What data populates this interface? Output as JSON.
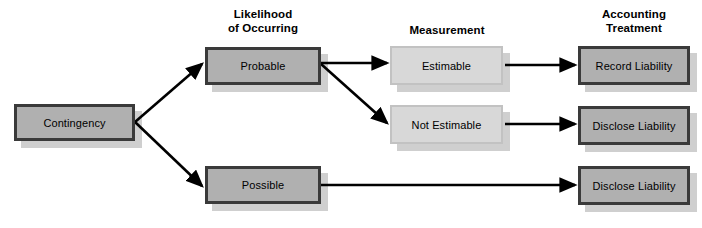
{
  "diagram": {
    "columns": [
      {
        "id": "likelihood",
        "heading": "Likelihood\nof Occurring"
      },
      {
        "id": "measurement",
        "heading": "Measurement"
      },
      {
        "id": "treatment",
        "heading": "Accounting\nTreatment"
      }
    ],
    "nodes": [
      {
        "id": "contingency",
        "label": "Contingency",
        "style": "dark",
        "x": 14,
        "y": 104,
        "w": 121,
        "h": 37
      },
      {
        "id": "probable",
        "label": "Probable",
        "style": "dark",
        "x": 205,
        "y": 47,
        "w": 116,
        "h": 38
      },
      {
        "id": "possible",
        "label": "Possible",
        "style": "dark",
        "x": 205,
        "y": 166,
        "w": 116,
        "h": 38
      },
      {
        "id": "estimable",
        "label": "Estimable",
        "style": "light",
        "x": 390,
        "y": 46,
        "w": 113,
        "h": 39
      },
      {
        "id": "not-estimable",
        "label": "Not Estimable",
        "style": "light",
        "x": 390,
        "y": 105,
        "w": 113,
        "h": 39
      },
      {
        "id": "record-liability",
        "label": "Record Liability",
        "style": "dark",
        "x": 578,
        "y": 46,
        "w": 112,
        "h": 39
      },
      {
        "id": "disclose-liability-1",
        "label": "Disclose Liability",
        "style": "dark",
        "x": 578,
        "y": 106,
        "w": 112,
        "h": 39
      },
      {
        "id": "disclose-liability-2",
        "label": "Disclose Liability",
        "style": "dark",
        "x": 578,
        "y": 166,
        "w": 112,
        "h": 39
      }
    ],
    "edges": [
      {
        "id": "contingency-to-probable",
        "from": "contingency",
        "to": "probable",
        "x1": 135,
        "y1": 122,
        "x2": 202,
        "y2": 64
      },
      {
        "id": "contingency-to-possible",
        "from": "contingency",
        "to": "possible",
        "x1": 135,
        "y1": 122,
        "x2": 202,
        "y2": 186
      },
      {
        "id": "probable-to-estimable",
        "from": "probable",
        "to": "estimable",
        "x1": 321,
        "y1": 63,
        "x2": 387,
        "y2": 63
      },
      {
        "id": "probable-to-not-estimable",
        "from": "probable",
        "to": "not-estimable",
        "x1": 321,
        "y1": 64,
        "x2": 387,
        "y2": 123
      },
      {
        "id": "estimable-to-record-liability",
        "from": "estimable",
        "to": "record-liability",
        "x1": 505,
        "y1": 65,
        "x2": 575,
        "y2": 65
      },
      {
        "id": "not-estimable-to-disclose",
        "from": "not-estimable",
        "to": "disclose-liability-1",
        "x1": 505,
        "y1": 124,
        "x2": 575,
        "y2": 124
      },
      {
        "id": "possible-to-disclose",
        "from": "possible",
        "to": "disclose-liability-2",
        "x1": 321,
        "y1": 185,
        "x2": 575,
        "y2": 185
      }
    ],
    "headings_layout": [
      {
        "id": "likelihood",
        "x": 186,
        "y": 8,
        "w": 154
      },
      {
        "id": "measurement",
        "x": 382,
        "y": 24,
        "w": 130
      },
      {
        "id": "treatment",
        "x": 568,
        "y": 8,
        "w": 132
      }
    ],
    "colors": {
      "box_dark_fill": "#b0b0b0",
      "box_dark_border": "#3a3a3a",
      "box_light_fill": "#d8d8d8",
      "box_light_border": "#c2c2c2",
      "shadow": "#cfcfcf",
      "arrow": "#000000",
      "text": "#000000",
      "background": "#ffffff"
    }
  }
}
